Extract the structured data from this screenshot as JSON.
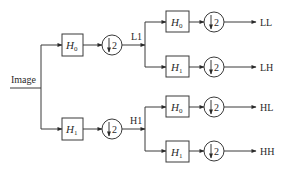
{
  "diagram": {
    "type": "wavelet-decomposition-filter-bank",
    "input": {
      "label": "Image"
    },
    "colors": {
      "stroke": "#3a3a3a",
      "text": "#2a2a2a",
      "background": "#ffffff"
    },
    "stage1": {
      "low": {
        "filter": "H",
        "filter_sub": "0",
        "downsample": "2",
        "output": "L1"
      },
      "high": {
        "filter": "H",
        "filter_sub": "1",
        "downsample": "2",
        "output": "H1"
      }
    },
    "stage2": {
      "ll": {
        "filter": "H",
        "filter_sub": "0",
        "downsample": "2",
        "output": "LL"
      },
      "lh": {
        "filter": "H",
        "filter_sub": "1",
        "downsample": "2",
        "output": "LH"
      },
      "hl": {
        "filter": "H",
        "filter_sub": "0",
        "downsample": "2",
        "output": "HL"
      },
      "hh": {
        "filter": "H",
        "filter_sub": "1",
        "downsample": "2",
        "output": "HH"
      }
    }
  }
}
